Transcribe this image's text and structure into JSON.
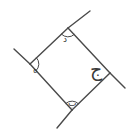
{
  "figure": {
    "kind": "geometry-diagram",
    "stroke_color": "#4a4a4a",
    "label_color": "#3a3a3a",
    "background_color": "#ffffff",
    "stroke_width": 1.4,
    "canvas": {
      "width": 130,
      "height": 139
    },
    "vertices": [
      {
        "id": "top",
        "x": 68,
        "y": 28,
        "label": "د",
        "angle_arc": true
      },
      {
        "id": "left",
        "x": 30,
        "y": 64,
        "label": "ه",
        "angle_arc": true
      },
      {
        "id": "bottom",
        "x": 72,
        "y": 110,
        "label": "ب",
        "angle_arc": true
      },
      {
        "id": "right",
        "x": 110,
        "y": 73,
        "label": "ج",
        "angle_arc": false
      }
    ],
    "sides": [
      {
        "id": "side-top-left",
        "from": "left",
        "to": "top"
      },
      {
        "id": "side-top-right",
        "from": "top",
        "to": "right"
      },
      {
        "id": "side-bottom-right",
        "from": "right",
        "to": "bottom"
      },
      {
        "id": "side-bottom-left",
        "from": "bottom",
        "to": "left"
      }
    ],
    "extensions": [
      {
        "id": "ext-top-upper-right",
        "x1": 68,
        "y1": 28,
        "x2": 90,
        "y2": 11
      },
      {
        "id": "ext-left-upper-left",
        "x1": 30,
        "y1": 64,
        "x2": 14,
        "y2": 49
      },
      {
        "id": "ext-right-lower",
        "x1": 110,
        "y1": 73,
        "x2": 125,
        "y2": 88
      },
      {
        "id": "ext-bottom-lower",
        "x1": 72,
        "y1": 110,
        "x2": 57,
        "y2": 128
      }
    ],
    "labels": {
      "top": {
        "text": "د",
        "x": 63,
        "y": 35,
        "size": "small"
      },
      "left": {
        "text": "ه",
        "x": 33,
        "y": 66,
        "size": "small"
      },
      "bottom": {
        "text": "ب",
        "x": 68,
        "y": 99,
        "size": "small"
      },
      "right": {
        "text": "ج",
        "x": 90,
        "y": 60,
        "size": "large"
      }
    }
  }
}
